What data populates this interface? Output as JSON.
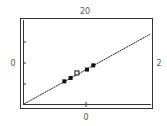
{
  "chart_data": {
    "type": "scatter",
    "title": "",
    "xlabel": "",
    "ylabel": "",
    "labels": {
      "top": "20",
      "left": "0",
      "right": "2",
      "bottom": "0"
    },
    "xlim": [
      0,
      1
    ],
    "ylim": [
      0,
      1
    ],
    "grid": false,
    "legend": "none",
    "fit_line": {
      "x": [
        0.0,
        1.0
      ],
      "y": [
        0.0,
        0.83
      ]
    },
    "points": [
      {
        "x": 0.32,
        "y": 0.27,
        "style": "filled"
      },
      {
        "x": 0.37,
        "y": 0.31,
        "style": "filled"
      },
      {
        "x": 0.42,
        "y": 0.37,
        "style": "open"
      },
      {
        "x": 0.5,
        "y": 0.41,
        "style": "filled"
      },
      {
        "x": 0.55,
        "y": 0.46,
        "style": "filled"
      }
    ],
    "colors": {
      "frame": "#333333",
      "line": "#222222",
      "marker": "#111111"
    }
  }
}
